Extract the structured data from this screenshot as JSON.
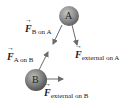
{
  "diagram": {
    "objects": [
      {
        "id": "A",
        "label": "A",
        "color": "#7a7a7a"
      },
      {
        "id": "B",
        "label": "B",
        "color": "#7a7a7a"
      }
    ],
    "forces": [
      {
        "symbol": "F",
        "subscript": "B on A"
      },
      {
        "symbol": "F",
        "subscript": "A on B"
      },
      {
        "symbol": "F",
        "subscript": "external on A"
      },
      {
        "symbol": "F",
        "subscript": "external on B"
      }
    ],
    "arrow_color": "#6b6b6b"
  }
}
